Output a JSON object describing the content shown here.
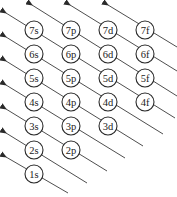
{
  "diagram": {
    "type": "aufbau-orbital-filling-order",
    "colors": {
      "stroke": "#2a2a2a",
      "text": "#222222",
      "background": "#ffffff"
    },
    "orbitals": [
      {
        "label": "7s",
        "row": 7,
        "col": 0
      },
      {
        "label": "7p",
        "row": 7,
        "col": 1
      },
      {
        "label": "7d",
        "row": 7,
        "col": 2
      },
      {
        "label": "7f",
        "row": 7,
        "col": 3
      },
      {
        "label": "6s",
        "row": 6,
        "col": 0
      },
      {
        "label": "6p",
        "row": 6,
        "col": 1
      },
      {
        "label": "6d",
        "row": 6,
        "col": 2
      },
      {
        "label": "6f",
        "row": 6,
        "col": 3
      },
      {
        "label": "5s",
        "row": 5,
        "col": 0
      },
      {
        "label": "5p",
        "row": 5,
        "col": 1
      },
      {
        "label": "5d",
        "row": 5,
        "col": 2
      },
      {
        "label": "5f",
        "row": 5,
        "col": 3
      },
      {
        "label": "4s",
        "row": 4,
        "col": 0
      },
      {
        "label": "4p",
        "row": 4,
        "col": 1
      },
      {
        "label": "4d",
        "row": 4,
        "col": 2
      },
      {
        "label": "4f",
        "row": 4,
        "col": 3
      },
      {
        "label": "3s",
        "row": 3,
        "col": 0
      },
      {
        "label": "3p",
        "row": 3,
        "col": 1
      },
      {
        "label": "3d",
        "row": 3,
        "col": 2
      },
      {
        "label": "2s",
        "row": 2,
        "col": 0
      },
      {
        "label": "2p",
        "row": 2,
        "col": 1
      },
      {
        "label": "1s",
        "row": 1,
        "col": 0
      }
    ],
    "arrows": [
      {
        "through": [
          "1s"
        ],
        "x1": 68,
        "y1": 193,
        "x2": 6,
        "y2": 157
      },
      {
        "through": [
          "2s"
        ],
        "x1": 87,
        "y1": 183,
        "x2": 6,
        "y2": 133
      },
      {
        "through": [
          "2p",
          "3s"
        ],
        "x1": 107,
        "y1": 171,
        "x2": 6,
        "y2": 109
      },
      {
        "through": [
          "3p",
          "4s"
        ],
        "x1": 125,
        "y1": 158,
        "x2": 6,
        "y2": 85
      },
      {
        "through": [
          "3d",
          "4p",
          "5s"
        ],
        "x1": 143,
        "y1": 146,
        "x2": 6,
        "y2": 61
      },
      {
        "through": [
          "4d",
          "5p",
          "6s"
        ],
        "x1": 163,
        "y1": 134,
        "x2": 6,
        "y2": 37
      },
      {
        "through": [
          "4f",
          "5d",
          "6p",
          "7s"
        ],
        "x1": 175,
        "y1": 118,
        "x2": 6,
        "y2": 13
      },
      {
        "through": [
          "5f",
          "6d",
          "7p"
        ],
        "x1": 177,
        "y1": 96,
        "x2": 32,
        "y2": 5
      },
      {
        "through": [
          "6f",
          "7d"
        ],
        "x1": 177,
        "y1": 71,
        "x2": 70,
        "y2": 5
      },
      {
        "through": [
          "7f"
        ],
        "x1": 177,
        "y1": 47,
        "x2": 108,
        "y2": 5
      }
    ]
  }
}
